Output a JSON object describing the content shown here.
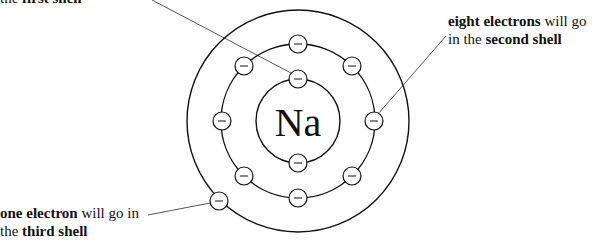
{
  "diagram": {
    "nucleus": {
      "symbol": "Na",
      "cx": 298,
      "cy": 121
    },
    "shells": [
      {
        "name": "first shell",
        "radius": 42,
        "electron_count": 2
      },
      {
        "name": "second shell",
        "radius": 77,
        "electron_count": 8
      },
      {
        "name": "third shell",
        "radius": 111,
        "electron_count": 1
      }
    ],
    "electron": {
      "radius": 9,
      "glyph": "−"
    },
    "electrons": [
      {
        "shell": 1,
        "x": 298,
        "y": 79
      },
      {
        "shell": 1,
        "x": 298,
        "y": 163
      },
      {
        "shell": 2,
        "x": 298,
        "y": 44
      },
      {
        "shell": 2,
        "x": 352,
        "y": 66
      },
      {
        "shell": 2,
        "x": 374,
        "y": 121
      },
      {
        "shell": 2,
        "x": 352,
        "y": 176
      },
      {
        "shell": 2,
        "x": 298,
        "y": 198
      },
      {
        "shell": 2,
        "x": 244,
        "y": 176
      },
      {
        "shell": 2,
        "x": 222,
        "y": 121
      },
      {
        "shell": 2,
        "x": 244,
        "y": 66
      },
      {
        "shell": 3,
        "x": 219,
        "y": 201
      }
    ],
    "annotations": {
      "first": {
        "line1": [
          {
            "text": "the ",
            "bold": false
          },
          {
            "text": "first shell",
            "bold": true
          }
        ],
        "pointer": {
          "x1": 152,
          "y1": 0,
          "x2": 291,
          "y2": 73
        }
      },
      "second": {
        "line1": [
          {
            "text": "eight electrons",
            "bold": true
          },
          {
            "text": " will go",
            "bold": false
          }
        ],
        "line2": [
          {
            "text": "in the ",
            "bold": false
          },
          {
            "text": "second shell",
            "bold": true
          }
        ],
        "pointer": {
          "x1": 446,
          "y1": 36,
          "x2": 378,
          "y2": 114
        }
      },
      "third": {
        "line1": [
          {
            "text": "one electron",
            "bold": true
          },
          {
            "text": " will go in",
            "bold": false
          }
        ],
        "line2": [
          {
            "text": "the ",
            "bold": false
          },
          {
            "text": "third shell",
            "bold": true
          }
        ],
        "pointer": {
          "x1": 148,
          "y1": 215,
          "x2": 210,
          "y2": 203
        }
      }
    },
    "colors": {
      "stroke": "#111111",
      "pointer": "#555555",
      "background": "#ffffff"
    }
  }
}
